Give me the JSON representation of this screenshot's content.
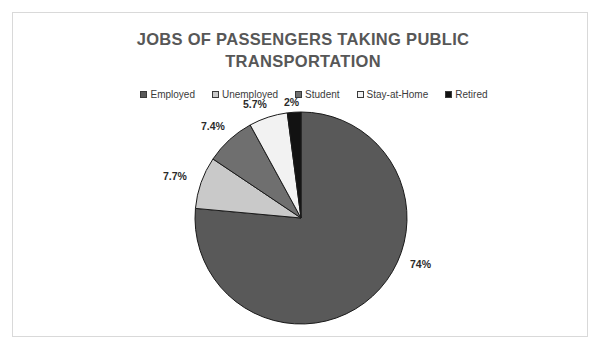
{
  "chart_data": {
    "type": "pie",
    "title": "JOBS OF PASSENGERS TAKING PUBLIC TRANSPORTATION",
    "title_line1": "JOBS OF PASSENGERS TAKING PUBLIC",
    "title_line2": "TRANSPORTATION",
    "legend_position": "top",
    "grid": false,
    "xlabel": "",
    "ylabel": "",
    "categories": [
      "Employed",
      "Unemployed",
      "Student",
      "Stay-at-Home",
      "Retired"
    ],
    "values": [
      74,
      7.7,
      7.4,
      5.7,
      2
    ],
    "labels": [
      "74%",
      "7.7%",
      "7.4%",
      "5.7%",
      "2%"
    ],
    "colors": [
      "#595959",
      "#c9c9c9",
      "#6f6f6f",
      "#f2f2f2",
      "#121212"
    ],
    "slices": [
      {
        "name": "Employed",
        "value": 74,
        "label": "74%",
        "color": "#595959"
      },
      {
        "name": "Unemployed",
        "value": 7.7,
        "label": "7.7%",
        "color": "#c9c9c9"
      },
      {
        "name": "Student",
        "value": 7.4,
        "label": "7.4%",
        "color": "#6f6f6f"
      },
      {
        "name": "Stay-at-Home",
        "value": 5.7,
        "label": "5.7%",
        "color": "#f2f2f2"
      },
      {
        "name": "Retired",
        "value": 2,
        "label": "2%",
        "color": "#121212"
      }
    ]
  },
  "chart": {
    "title_line1": "JOBS OF PASSENGERS TAKING PUBLIC",
    "title_line2": "TRANSPORTATION",
    "legend": [
      {
        "label": "Employed",
        "color": "#595959"
      },
      {
        "label": "Unemployed",
        "color": "#c9c9c9"
      },
      {
        "label": "Student",
        "color": "#6f6f6f"
      },
      {
        "label": "Stay-at-Home",
        "color": "#f2f2f2"
      },
      {
        "label": "Retired",
        "color": "#121212"
      }
    ],
    "data_labels": {
      "employed": "74%",
      "unemployed": "7.7%",
      "student": "7.4%",
      "stay_at_home": "5.7%",
      "retired": "2%"
    }
  },
  "style": {
    "title_color": "#575757",
    "label_color": "#2b2b2b",
    "frame_color": "#d9d9d9",
    "background": "#ffffff",
    "slice_outline": "#1a1a1a"
  }
}
